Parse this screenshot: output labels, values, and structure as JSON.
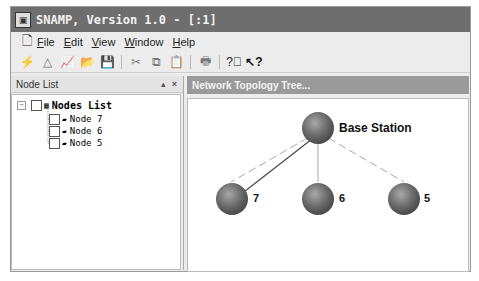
{
  "window": {
    "title": "SNAMP, Version 1.0 - [:1]"
  },
  "menu": [
    {
      "label": "File",
      "u": "F",
      "rest": "ile"
    },
    {
      "label": "Edit",
      "u": "E",
      "rest": "dit"
    },
    {
      "label": "View",
      "u": "V",
      "rest": "iew"
    },
    {
      "label": "Window",
      "u": "W",
      "rest": "indow"
    },
    {
      "label": "Help",
      "u": "H",
      "rest": "elp"
    }
  ],
  "toolbar": {
    "icons": [
      "flash-icon",
      "topology-icon",
      "chart-icon",
      "open-folder-icon",
      "save-icon",
      "cut-icon",
      "copy-icon",
      "paste-icon",
      "print-icon",
      "help-icon",
      "context-help-icon"
    ]
  },
  "left_panel": {
    "title": "Node List",
    "pin": "▴",
    "close": "×",
    "tree": {
      "root": {
        "expander": "−",
        "label": "Nodes List"
      },
      "children": [
        {
          "label": "Node 7"
        },
        {
          "label": "Node 6"
        },
        {
          "label": "Node 5"
        }
      ]
    }
  },
  "right_panel": {
    "title": "Network Topology Tree...",
    "topology": {
      "root": {
        "label": "Base Station"
      },
      "nodes": [
        {
          "label": "7"
        },
        {
          "label": "6"
        },
        {
          "label": "5"
        }
      ]
    }
  }
}
